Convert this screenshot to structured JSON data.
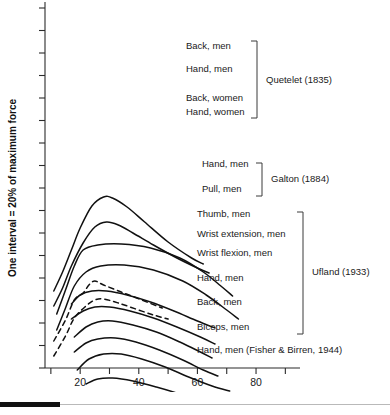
{
  "axes": {
    "y_title": "One interval = 20% of maximum force",
    "x_title": "Age (years)",
    "x_ticks": [
      10,
      20,
      30,
      40,
      50,
      60,
      70,
      80,
      90
    ],
    "x_tick_labels": [
      "",
      "20",
      "",
      "40",
      "",
      "60",
      "",
      "80",
      ""
    ],
    "x_range": [
      8,
      95
    ],
    "y_tick_count": 17,
    "grid": false
  },
  "groups": [
    {
      "id": "quetelet",
      "source": "Quetelet (1835)",
      "label_x": 186,
      "bracket": {
        "x": 257,
        "y1": 41,
        "y2": 118,
        "cap": 6
      },
      "source_x": 266,
      "source_y": 83,
      "series": [
        {
          "name": "Back, men",
          "label_y": 49,
          "style": "solid"
        },
        {
          "name": "Hand, men",
          "label_y": 72,
          "style": "solid"
        },
        {
          "name": "Back, women",
          "label_y": 101,
          "style": "dashed"
        },
        {
          "name": "Hand, women",
          "label_y": 115,
          "style": "dashed"
        }
      ]
    },
    {
      "id": "galton",
      "source": "Galton (1884)",
      "label_x": 202,
      "bracket": {
        "x": 262,
        "y1": 163,
        "y2": 196,
        "cap": 6
      },
      "source_x": 271,
      "source_y": 182,
      "series": [
        {
          "name": "Hand, men",
          "label_y": 167,
          "style": "solid"
        },
        {
          "name": "Pull, men",
          "label_y": 192,
          "style": "solid"
        }
      ]
    },
    {
      "id": "ufland",
      "source": "Ufland (1933)",
      "label_x": 197,
      "bracket": {
        "x": 303,
        "y1": 212,
        "y2": 334,
        "cap": 6
      },
      "source_x": 312,
      "source_y": 275,
      "series": [
        {
          "name": "Thumb, men",
          "label_y": 217,
          "style": "solid"
        },
        {
          "name": "Wrist extension, men",
          "label_y": 237,
          "style": "solid"
        },
        {
          "name": "Wrist flexion, men",
          "label_y": 256,
          "style": "solid"
        },
        {
          "name": "Hand, men",
          "label_y": 281,
          "style": "solid"
        },
        {
          "name": "Back, men",
          "label_y": 305,
          "style": "solid"
        },
        {
          "name": "Biceps, men",
          "label_y": 330,
          "style": "solid"
        }
      ]
    },
    {
      "id": "fisher_birren",
      "source": "",
      "label_x": 197,
      "bracket": null,
      "source_x": 0,
      "source_y": 0,
      "series": [
        {
          "name": "Hand, men (Fisher & Birren, 1944)",
          "label_y": 353,
          "style": "solid"
        }
      ]
    }
  ],
  "chart_data": {
    "type": "line",
    "title": "",
    "xlabel": "Age (years)",
    "ylabel": "One interval = 20% of maximum force",
    "xlim": [
      8,
      95
    ],
    "grid": false,
    "legend": "right-labels-with-brackets",
    "note": "Muscle strength vs age; each curve vertically offset by one interval (20% of maximum force).",
    "series": [
      {
        "name": "Back, men",
        "source": "Quetelet (1835)",
        "style": "solid",
        "x": [
          11,
          14,
          17,
          20,
          24,
          28,
          31,
          36,
          42,
          50,
          58,
          62
        ],
        "y": [
          291,
          272,
          250,
          228,
          206,
          197,
          198,
          207,
          222,
          242,
          258,
          264
        ]
      },
      {
        "name": "Hand, men",
        "source": "Quetelet (1835)",
        "style": "solid",
        "x": [
          11,
          14,
          17,
          21,
          25,
          29,
          33,
          38,
          45,
          53,
          60,
          64
        ],
        "y": [
          306,
          288,
          266,
          243,
          227,
          222,
          225,
          233,
          245,
          258,
          268,
          273
        ]
      },
      {
        "name": "Back, women",
        "source": "Quetelet (1835)",
        "style": "dashed",
        "x": [
          11,
          15,
          18,
          21,
          23,
          25,
          28,
          34,
          41,
          48
        ],
        "y": [
          341,
          320,
          300,
          293,
          285,
          281,
          285,
          292,
          300,
          308
        ]
      },
      {
        "name": "Hand, women",
        "source": "Quetelet (1835)",
        "style": "dashed",
        "x": [
          11,
          15,
          18,
          22,
          25,
          28,
          33,
          39,
          45,
          50
        ],
        "y": [
          356,
          336,
          318,
          306,
          300,
          299,
          303,
          309,
          315,
          319
        ]
      },
      {
        "name": "Hand, men",
        "source": "Galton (1884)",
        "style": "solid",
        "x": [
          12,
          15,
          18,
          21,
          26,
          34,
          44,
          54,
          62,
          68,
          72
        ],
        "y": [
          314,
          290,
          266,
          250,
          245,
          244,
          248,
          258,
          272,
          286,
          296
        ]
      },
      {
        "name": "Pull, men",
        "source": "Galton (1884)",
        "style": "solid",
        "x": [
          12,
          15,
          18,
          22,
          27,
          35,
          45,
          55,
          63,
          70,
          74
        ],
        "y": [
          330,
          308,
          286,
          272,
          266,
          265,
          270,
          281,
          295,
          310,
          319
        ]
      },
      {
        "name": "Thumb, men",
        "source": "Ufland (1933)",
        "style": "solid",
        "x": [
          17,
          20,
          24,
          29,
          36,
          44,
          52,
          60,
          66
        ],
        "y": [
          304,
          295,
          291,
          291,
          295,
          302,
          311,
          321,
          328
        ]
      },
      {
        "name": "Wrist extension, men",
        "source": "Ufland (1933)",
        "style": "solid",
        "x": [
          17,
          21,
          25,
          30,
          37,
          45,
          53,
          61,
          66
        ],
        "y": [
          319,
          311,
          307,
          307,
          311,
          318,
          327,
          337,
          344
        ]
      },
      {
        "name": "Wrist flexion, men",
        "source": "Ufland (1933)",
        "style": "solid",
        "x": [
          18,
          22,
          26,
          31,
          38,
          46,
          54,
          61,
          65
        ],
        "y": [
          337,
          327,
          322,
          321,
          325,
          332,
          342,
          352,
          358
        ]
      },
      {
        "name": "Hand, men",
        "source": "Ufland (1933)",
        "style": "solid",
        "x": [
          18,
          22,
          26,
          32,
          39,
          47,
          55,
          62,
          67
        ],
        "y": [
          352,
          343,
          339,
          338,
          342,
          350,
          360,
          370,
          376
        ]
      },
      {
        "name": "Back, men",
        "source": "Ufland (1933)",
        "style": "solid",
        "x": [
          19,
          23,
          28,
          34,
          41,
          49,
          57,
          65,
          71
        ],
        "y": [
          370,
          359,
          354,
          354,
          359,
          367,
          377,
          386,
          391
        ]
      },
      {
        "name": "Biceps, men",
        "source": "Ufland (1933)",
        "style": "solid",
        "x": [
          22,
          26,
          31,
          38,
          46,
          54,
          61,
          66
        ],
        "y": [
          384,
          379,
          378,
          381,
          387,
          394,
          401,
          406
        ]
      },
      {
        "name": "Hand, men",
        "source": "Fisher & Birren (1944)",
        "style": "solid",
        "x": [
          21,
          26,
          32,
          40,
          48,
          55,
          60
        ],
        "y": [
          402,
          398,
          398,
          402,
          409,
          416,
          421
        ]
      }
    ]
  }
}
